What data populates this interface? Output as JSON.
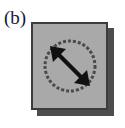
{
  "figure": {
    "panel_label": "(b)",
    "background_color": "#ffffff"
  },
  "button": {
    "name": "resize-tool-button",
    "state": "raised",
    "face_color": "#a9a9a9",
    "border_color": "#3c3c3c",
    "shadow_color": "#4d4d4d",
    "icon": {
      "name": "resize-diagonal-arrow-icon",
      "description": "double-headed diagonal arrow inside a circle",
      "glyph_color": "#111111",
      "circle_color": "#4a4a4a",
      "direction": "nw-se"
    }
  }
}
